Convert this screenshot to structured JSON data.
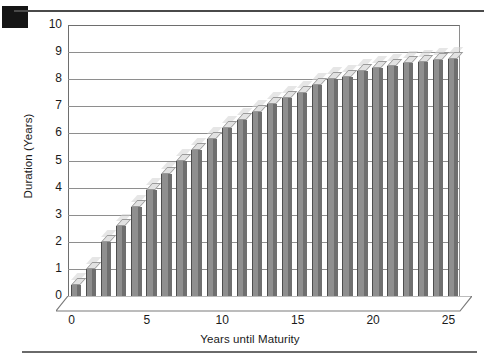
{
  "figure": {
    "corner_mark": "black-square-marker",
    "top_rule": "horizontal-rule",
    "bottom_rule": "horizontal-rule"
  },
  "chart_data": {
    "type": "bar",
    "title": "",
    "subtitle": "",
    "xlabel": "Years until Maturity",
    "ylabel": "Duration (Years)",
    "xlim": [
      0,
      25
    ],
    "ylim": [
      0,
      10
    ],
    "ytick_labels": [
      "10",
      "9",
      "8",
      "7",
      "6",
      "5",
      "4",
      "3",
      "2",
      "1",
      "0"
    ],
    "ytick_values": [
      10,
      9,
      8,
      7,
      6,
      5,
      4,
      3,
      2,
      1,
      0
    ],
    "xtick_labels": [
      "0",
      "5",
      "10",
      "15",
      "20",
      "25"
    ],
    "xtick_values": [
      0,
      5,
      10,
      15,
      20,
      25
    ],
    "grid": "horizontal",
    "legend": "none",
    "style": "3d-columns-grayscale",
    "bar_face_color": "#8f8f8f",
    "bar_side_color": "#6f6f6f",
    "bar_top_color": "#e2e2e2",
    "grid_color": "#8e8e8e",
    "categories": [
      0,
      1,
      2,
      3,
      4,
      5,
      6,
      7,
      8,
      9,
      10,
      11,
      12,
      13,
      14,
      15,
      16,
      17,
      18,
      19,
      20,
      21,
      22,
      23,
      24,
      25
    ],
    "values": [
      0.4,
      1.0,
      2.0,
      2.6,
      3.3,
      3.9,
      4.5,
      5.0,
      5.4,
      5.8,
      6.2,
      6.5,
      6.8,
      7.1,
      7.3,
      7.5,
      7.8,
      8.0,
      8.1,
      8.3,
      8.4,
      8.5,
      8.6,
      8.65,
      8.7,
      8.75
    ],
    "series": [
      {
        "name": "Duration",
        "values": [
          0.4,
          1.0,
          2.0,
          2.6,
          3.3,
          3.9,
          4.5,
          5.0,
          5.4,
          5.8,
          6.2,
          6.5,
          6.8,
          7.1,
          7.3,
          7.5,
          7.8,
          8.0,
          8.1,
          8.3,
          8.4,
          8.5,
          8.6,
          8.65,
          8.7,
          8.75
        ]
      }
    ]
  }
}
